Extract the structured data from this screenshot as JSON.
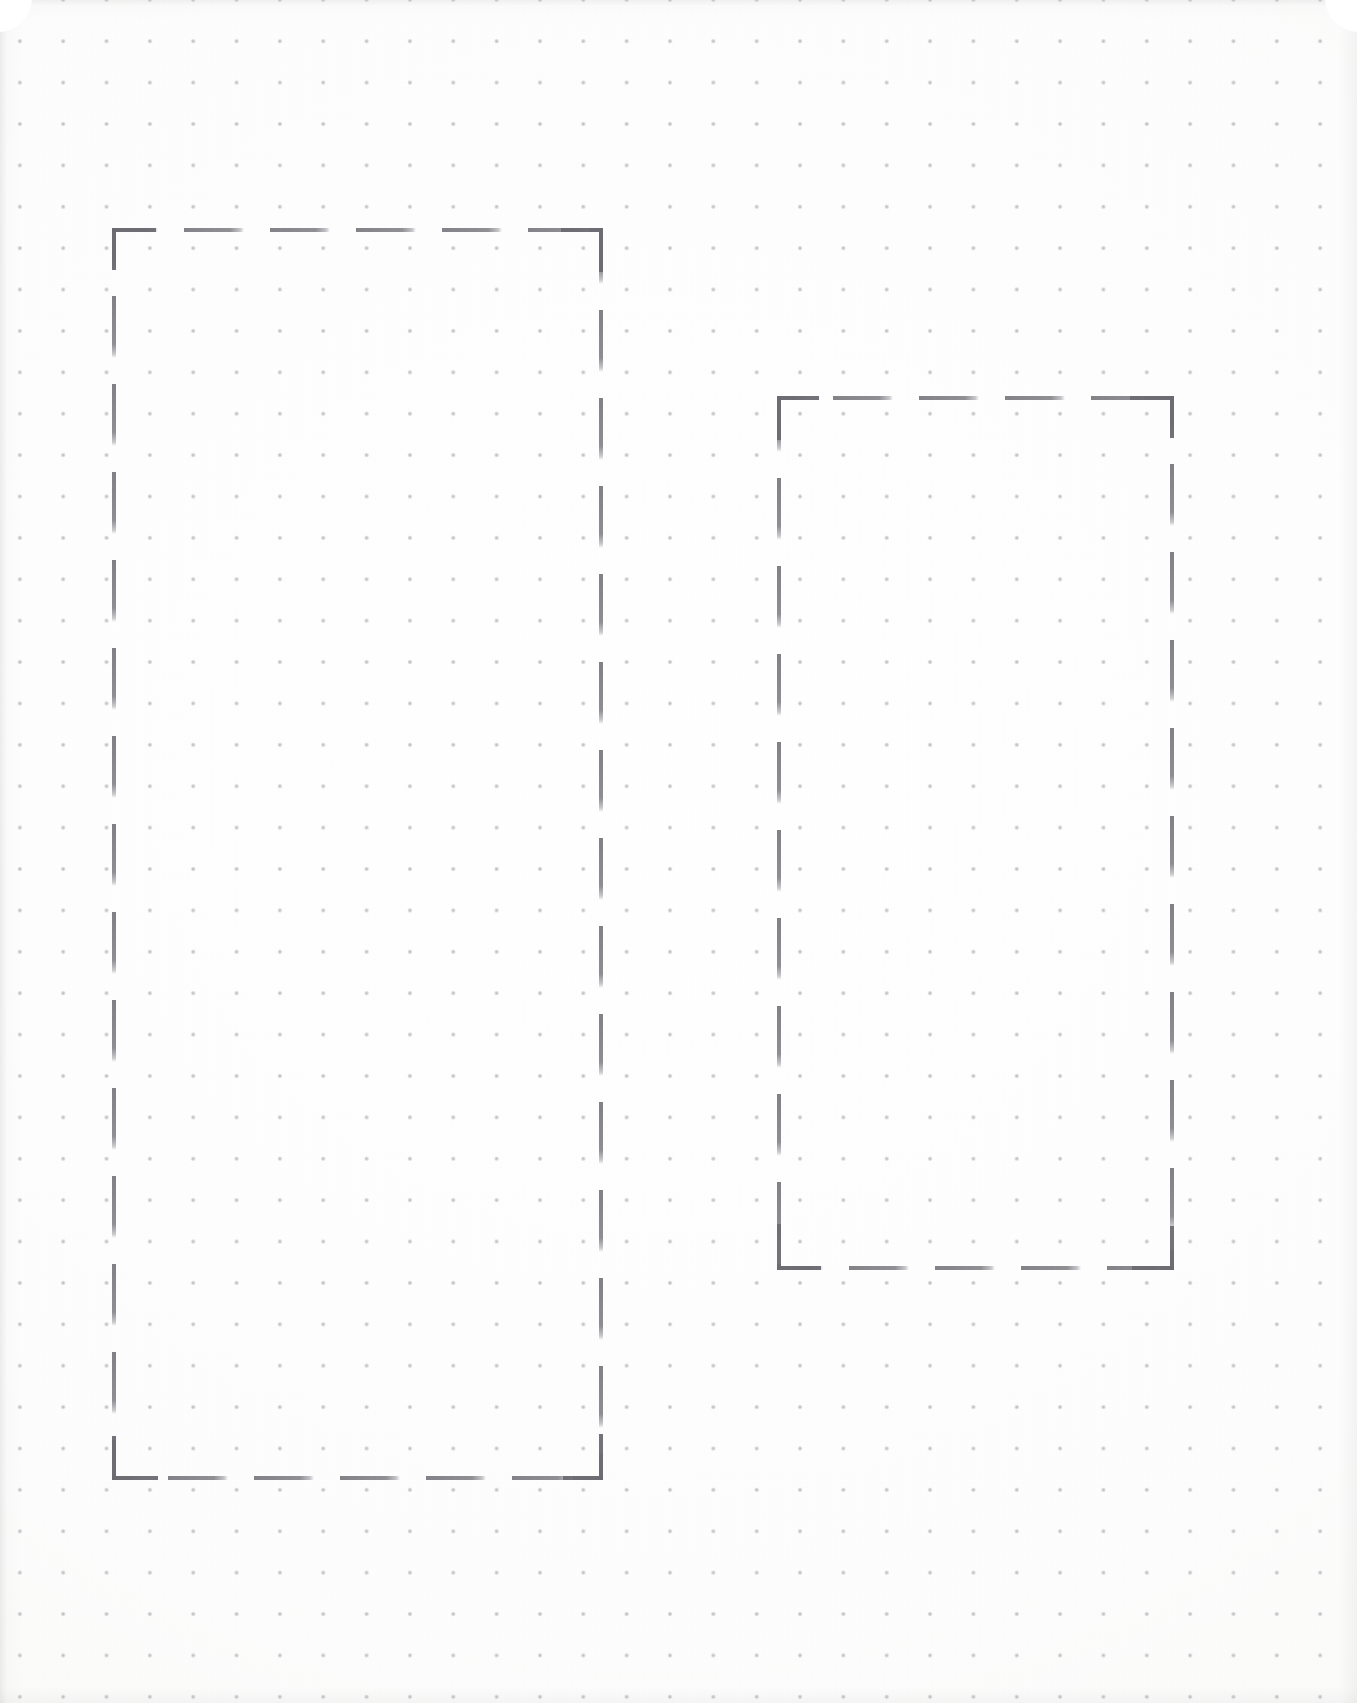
{
  "page": {
    "kind": "dot-grid-notebook-page",
    "width": 1357,
    "height": 1703,
    "background_color": "#fdfdfc",
    "paper_tone": "#ffffff"
  },
  "grid": {
    "name": "dot-grid",
    "dot_color": "#bfbfc4",
    "dot_radius_px": 1.6,
    "spacing_x_px": 43.35,
    "spacing_y_px": 41.4,
    "origin_x_px": 41.5,
    "origin_y_px": 20.5,
    "columns": 30,
    "rows": 41
  },
  "drawing": {
    "tool": "pencil",
    "stroke_color": "#7a7a80",
    "stroke_style": "dashed",
    "stroke_width_px": 4,
    "dash_length_px": 56,
    "dash_gap_px": 28,
    "shapes": [
      {
        "id": "box-left",
        "label": "left dashed rectangle",
        "type": "rectangle",
        "x": 112,
        "y": 228,
        "width": 491,
        "height": 1252,
        "right": 603,
        "bottom": 1480,
        "grid_columns_spanned": 11,
        "grid_rows_spanned": 30
      },
      {
        "id": "box-right",
        "label": "right dashed rectangle",
        "type": "rectangle",
        "x": 777,
        "y": 396,
        "width": 397,
        "height": 874,
        "right": 1174,
        "bottom": 1270,
        "grid_columns_spanned": 9,
        "grid_rows_spanned": 21
      }
    ]
  },
  "content": {
    "text_elements": [],
    "note": ""
  }
}
